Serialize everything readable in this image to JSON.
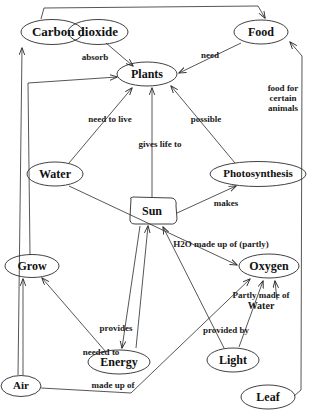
{
  "diagram": {
    "stroke_color": "#2b2b2b",
    "text_color": "#111111",
    "background": "#ffffff",
    "nodes": [
      {
        "id": "carbon_dioxide",
        "label": "Carbon dioxide",
        "label_part1": "Carbon",
        "label_part2": "dioxide",
        "x": 75,
        "y": 32,
        "shape": "double-ellipse",
        "font_size": 13
      },
      {
        "id": "food",
        "label": "Food",
        "x": 261,
        "y": 32,
        "shape": "ellipse",
        "font_size": 12
      },
      {
        "id": "plants",
        "label": "Plants",
        "x": 147,
        "y": 74,
        "shape": "ellipse",
        "font_size": 12
      },
      {
        "id": "water",
        "label": "Water",
        "x": 55,
        "y": 174,
        "shape": "ellipse",
        "font_size": 12
      },
      {
        "id": "photosynthesis",
        "label": "Photosynthesis",
        "x": 258,
        "y": 174,
        "shape": "ellipse",
        "font_size": 11
      },
      {
        "id": "sun",
        "label": "Sun",
        "x": 152,
        "y": 211,
        "shape": "rounded-rect",
        "font_size": 12
      },
      {
        "id": "grow",
        "label": "Grow",
        "x": 32,
        "y": 266,
        "shape": "ellipse",
        "font_size": 12
      },
      {
        "id": "oxygen",
        "label": "Oxygen",
        "x": 269,
        "y": 266,
        "shape": "ellipse",
        "font_size": 12
      },
      {
        "id": "energy",
        "label": "Energy",
        "x": 119,
        "y": 362,
        "shape": "ellipse",
        "font_size": 12
      },
      {
        "id": "light",
        "label": "Light",
        "x": 233,
        "y": 360,
        "shape": "ellipse",
        "font_size": 12
      },
      {
        "id": "air",
        "label": "Air",
        "x": 21,
        "y": 386,
        "shape": "ellipse",
        "font_size": 11
      },
      {
        "id": "leaf",
        "label": "Leaf",
        "x": 268,
        "y": 397,
        "shape": "ellipse",
        "font_size": 12
      }
    ],
    "edge_labels": [
      {
        "id": "absorb",
        "text": "absorb",
        "x": 95,
        "y": 57,
        "font_size": 9
      },
      {
        "id": "need",
        "text": "need",
        "x": 210,
        "y": 55,
        "font_size": 9
      },
      {
        "id": "food_for_certain_animals",
        "text": "food for certain animals",
        "line1": "food for",
        "line2": "certain",
        "line3": "animals",
        "x": 283,
        "y": 98,
        "font_size": 9
      },
      {
        "id": "need_to_live",
        "text": "need to live",
        "x": 110,
        "y": 119,
        "font_size": 9
      },
      {
        "id": "possible",
        "text": "possible",
        "x": 206,
        "y": 119,
        "font_size": 9
      },
      {
        "id": "gives_life_to",
        "text": "gives life to",
        "x": 160,
        "y": 144,
        "font_size": 9
      },
      {
        "id": "makes",
        "text": "makes",
        "x": 226,
        "y": 203,
        "font_size": 9
      },
      {
        "id": "h2o_made_up_of_partly",
        "text": "H2O made up of (partly)",
        "x": 221,
        "y": 244,
        "font_size": 9
      },
      {
        "id": "partly_made_of_water",
        "text": "Partly made of Water",
        "line1": "Partly made of",
        "line2": "Water",
        "x": 261,
        "y": 301,
        "font_size": 9
      },
      {
        "id": "provides",
        "text": "provides",
        "x": 116,
        "y": 328,
        "font_size": 9
      },
      {
        "id": "provided_by",
        "text": "provided by",
        "x": 226,
        "y": 330,
        "font_size": 9
      },
      {
        "id": "needed_to",
        "text": "needed to",
        "x": 101,
        "y": 352,
        "font_size": 9
      },
      {
        "id": "made_up_of",
        "text": "made up of",
        "x": 113,
        "y": 385,
        "font_size": 9
      }
    ]
  }
}
